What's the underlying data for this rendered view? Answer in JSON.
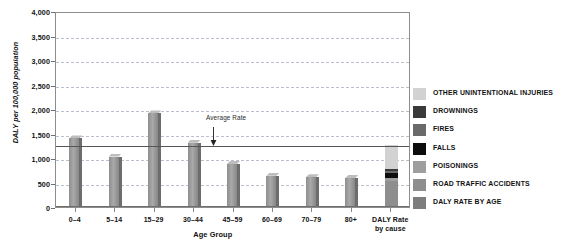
{
  "chart_data": {
    "type": "bar",
    "title": "",
    "xlabel": "Age Group",
    "ylabel": "DALY per 100,000 population",
    "ylim": [
      0,
      4000
    ],
    "yticks": [
      "0",
      "500",
      "1,000",
      "1,500",
      "2,000",
      "2,500",
      "3,000",
      "3,500",
      "4,000"
    ],
    "ytick_values": [
      0,
      500,
      1000,
      1500,
      2000,
      2500,
      3000,
      3500,
      4000
    ],
    "grid": "horizontal-dashed",
    "legend_position": "right",
    "categories": [
      "0–4",
      "5–14",
      "15–29",
      "30–44",
      "45–59",
      "60–69",
      "70–79",
      "80+"
    ],
    "values": [
      1400,
      1030,
      1910,
      1310,
      880,
      640,
      610,
      590
    ],
    "annotations": [
      {
        "label": "Average Rate",
        "value": 1280,
        "type": "horizontal-line-with-arrow"
      }
    ],
    "stacked_column": {
      "label_line1": "DALY Rate",
      "label_line2": "by cause",
      "total": 1270,
      "segments": [
        {
          "name": "ROAD TRAFFIC ACCIDENTS",
          "value": 530,
          "color": "#8e8e8e"
        },
        {
          "name": "POISONINGS",
          "value": 60,
          "color": "#9e9e9e"
        },
        {
          "name": "FALLS",
          "value": 105,
          "color": "#0d0d0d"
        },
        {
          "name": "FIRES",
          "value": 40,
          "color": "#6a6a6a"
        },
        {
          "name": "DROWNINGS",
          "value": 35,
          "color": "#3a3a3a"
        },
        {
          "name": "OTHER UNINTENTIONAL INJURIES",
          "value": 500,
          "color": "#d2d2d2"
        }
      ]
    },
    "legend": [
      {
        "label": "OTHER UNINTENTIONAL INJURIES",
        "color": "#d2d2d2"
      },
      {
        "label": "DROWNINGS",
        "color": "#3a3a3a"
      },
      {
        "label": "FIRES",
        "color": "#6a6a6a"
      },
      {
        "label": "FALLS",
        "color": "#0d0d0d"
      },
      {
        "label": "POISONINGS",
        "color": "#9e9e9e"
      },
      {
        "label": "ROAD TRAFFIC ACCIDENTS",
        "color": "#8e8e8e"
      },
      {
        "label": "DALY RATE BY AGE",
        "color": "#7d7d7d"
      }
    ]
  }
}
